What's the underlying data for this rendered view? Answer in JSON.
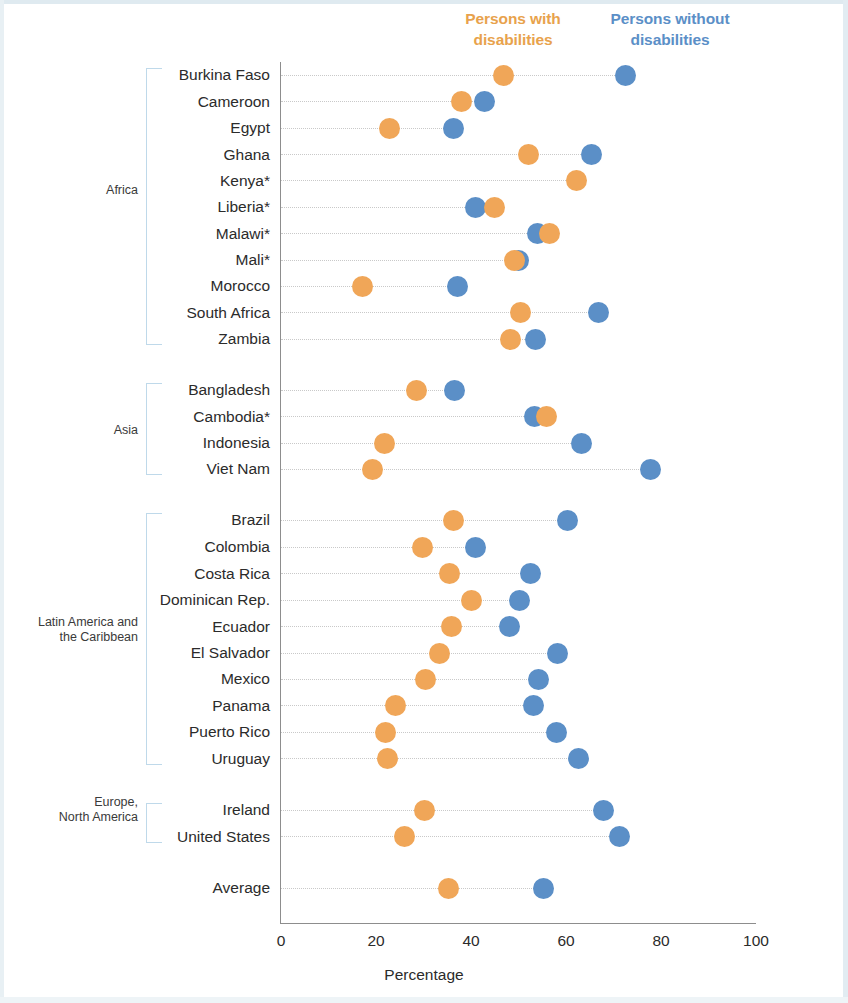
{
  "legend": {
    "with_line1": "Persons with",
    "with_line2": "disabilities",
    "without_line1": "Persons without",
    "without_line2": "disabilities",
    "with_color": "#F0A658",
    "without_color": "#5B8FC7"
  },
  "axis": {
    "title": "Percentage",
    "ticks": [
      "0",
      "20",
      "40",
      "60",
      "80",
      "100"
    ]
  },
  "groups": [
    {
      "label_line1": "Africa",
      "label_line2": ""
    },
    {
      "label_line1": "Asia",
      "label_line2": ""
    },
    {
      "label_line1": "Latin America and",
      "label_line2": "the Caribbean"
    },
    {
      "label_line1": "Europe,",
      "label_line2": "North America"
    }
  ],
  "chart_data": {
    "type": "scatter",
    "title": "",
    "subtitle": "",
    "xlabel": "Percentage",
    "ylabel": "",
    "xlim": [
      0,
      100
    ],
    "xticks": [
      0,
      20,
      40,
      60,
      80,
      100
    ],
    "grid": true,
    "legend_position": "top-right",
    "series": [
      {
        "name": "Persons with disabilities",
        "color": "#F0A658",
        "values": [
          46.9,
          38.1,
          22.8,
          52.2,
          62.2,
          45.0,
          56.5,
          49.2,
          17.1,
          50.4,
          48.4,
          28.6,
          55.8,
          21.8,
          19.3,
          36.3,
          29.8,
          35.4,
          40.0,
          35.9,
          33.4,
          30.4,
          24.1,
          21.9,
          22.5,
          30.2,
          25.9,
          35.2
        ]
      },
      {
        "name": "Persons without disabilities",
        "color": "#5B8FC7",
        "values": [
          72.5,
          42.9,
          36.4,
          65.3,
          null,
          41.0,
          54.1,
          50.1,
          37.2,
          66.9,
          53.5,
          36.6,
          53.3,
          63.2,
          77.8,
          60.4,
          41.0,
          52.6,
          50.3,
          48.1,
          58.3,
          54.3,
          53.1,
          57.9,
          62.7,
          67.9,
          71.2,
          55.3
        ]
      }
    ],
    "categories": [
      "Burkina Faso",
      "Cameroon",
      "Egypt",
      "Ghana",
      "Kenya*",
      "Liberia*",
      "Malawi*",
      "Mali*",
      "Morocco",
      "South Africa",
      "Zambia",
      "Bangladesh",
      "Cambodia*",
      "Indonesia",
      "Viet Nam",
      "Brazil",
      "Colombia",
      "Costa Rica",
      "Dominican Rep.",
      "Ecuador",
      "El Salvador",
      "Mexico",
      "Panama",
      "Puerto Rico",
      "Uruguay",
      "Ireland",
      "United States",
      "Average"
    ],
    "category_groups": [
      "Africa",
      "Africa",
      "Africa",
      "Africa",
      "Africa",
      "Africa",
      "Africa",
      "Africa",
      "Africa",
      "Africa",
      "Africa",
      "Asia",
      "Asia",
      "Asia",
      "Asia",
      "Latin America and the Caribbean",
      "Latin America and the Caribbean",
      "Latin America and the Caribbean",
      "Latin America and the Caribbean",
      "Latin America and the Caribbean",
      "Latin America and the Caribbean",
      "Latin America and the Caribbean",
      "Latin America and the Caribbean",
      "Latin America and the Caribbean",
      "Latin America and the Caribbean",
      "Europe, North America",
      "Europe, North America",
      ""
    ]
  },
  "layout": {
    "row_y": [
      75,
      101.5,
      128,
      154.5,
      180.5,
      207,
      233.5,
      260,
      286,
      312.5,
      339,
      390,
      416.5,
      443,
      469,
      520,
      547,
      573.5,
      600,
      626.5,
      653,
      679,
      705.5,
      732,
      758.5,
      810,
      836.5,
      888
    ],
    "bracket_groups": [
      {
        "top": 68,
        "bottom": 345,
        "label_y": 183,
        "lines": 1
      },
      {
        "top": 383,
        "bottom": 475,
        "label_y": 423,
        "lines": 1
      },
      {
        "top": 513,
        "bottom": 765,
        "label_y": 623,
        "lines": 2
      },
      {
        "top": 803,
        "bottom": 843,
        "label_y": 803,
        "lines": 2
      }
    ],
    "x0_px": 281,
    "px_per_unit": 4.75
  }
}
